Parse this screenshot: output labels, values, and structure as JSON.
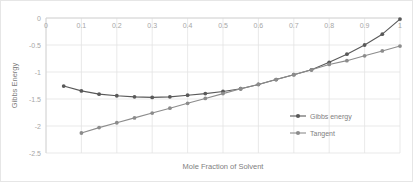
{
  "chart_data": {
    "type": "line",
    "title": "",
    "xlabel": "Mole Fraction of Solvent",
    "ylabel": "Gibbs Energy",
    "xlim": [
      0,
      1
    ],
    "ylim": [
      -2.5,
      0
    ],
    "xticks": [
      "0",
      "0.1",
      "0.2",
      "0.3",
      "0.4",
      "0.5",
      "0.6",
      "0.7",
      "0.8",
      "0.9",
      "1"
    ],
    "xtick_values": [
      0,
      0.1,
      0.2,
      0.3,
      0.4,
      0.5,
      0.6,
      0.7,
      0.8,
      0.9,
      1
    ],
    "yticks": [
      "0",
      "-0.5",
      "-1",
      "-1.5",
      "-2",
      "-2.5"
    ],
    "ytick_values": [
      0,
      -0.5,
      -1,
      -1.5,
      -2,
      -2.5
    ],
    "grid": true,
    "legend_position": "inside-right",
    "markers": true,
    "series": [
      {
        "name": "Gibbs energy",
        "color": "#595959",
        "x": [
          0.05,
          0.1,
          0.15,
          0.2,
          0.25,
          0.3,
          0.35,
          0.4,
          0.45,
          0.5,
          0.55,
          0.6,
          0.65,
          0.7,
          0.75,
          0.8,
          0.85,
          0.9,
          0.95,
          1.0
        ],
        "values": [
          -1.26,
          -1.35,
          -1.41,
          -1.44,
          -1.46,
          -1.47,
          -1.46,
          -1.43,
          -1.4,
          -1.36,
          -1.31,
          -1.23,
          -1.14,
          -1.05,
          -0.96,
          -0.82,
          -0.67,
          -0.5,
          -0.3,
          -0.02
        ]
      },
      {
        "name": "Tangent",
        "color": "#8c8c8c",
        "x": [
          0.1,
          0.15,
          0.2,
          0.25,
          0.3,
          0.35,
          0.4,
          0.45,
          0.5,
          0.55,
          0.6,
          0.65,
          0.7,
          0.75,
          0.8,
          0.85,
          0.9,
          0.95,
          1.0
        ],
        "values": [
          -2.13,
          -2.03,
          -1.94,
          -1.85,
          -1.76,
          -1.67,
          -1.58,
          -1.49,
          -1.4,
          -1.31,
          -1.23,
          -1.14,
          -1.05,
          -0.96,
          -0.86,
          -0.79,
          -0.7,
          -0.61,
          -0.52
        ]
      }
    ]
  },
  "legend": {
    "items": [
      {
        "label": "Gibbs energy"
      },
      {
        "label": "Tangent"
      }
    ]
  }
}
